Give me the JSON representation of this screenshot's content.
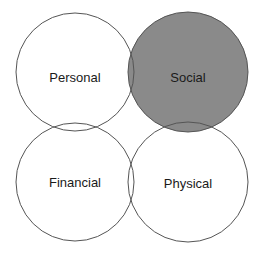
{
  "diagram": {
    "type": "four-circle overlap diagram",
    "highlight_color": "#8a8a8a",
    "stroke_color": "#555555",
    "background": "#ffffff",
    "circles": [
      {
        "id": "personal",
        "label": "Personal",
        "cx": 75,
        "cy": 72,
        "r": 59,
        "highlighted": false
      },
      {
        "id": "social",
        "label": "Social",
        "cx": 188,
        "cy": 72,
        "r": 60,
        "highlighted": true
      },
      {
        "id": "financial",
        "label": "Financial",
        "cx": 75,
        "cy": 182,
        "r": 59,
        "highlighted": false
      },
      {
        "id": "physical",
        "label": "Physical",
        "cx": 188,
        "cy": 182,
        "r": 60,
        "highlighted": false
      }
    ]
  }
}
